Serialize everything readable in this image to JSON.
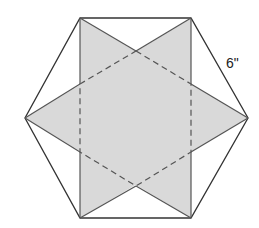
{
  "diagram": {
    "side_label": "6\"",
    "colors": {
      "fill": "#d9d9d9",
      "stroke": "#333333",
      "background": "#ffffff"
    },
    "outer_hexagon": [
      [
        80,
        18
      ],
      [
        191,
        18
      ],
      [
        248,
        118
      ],
      [
        191,
        218
      ],
      [
        80,
        218
      ],
      [
        25,
        118
      ]
    ],
    "triangle_1": [
      [
        80,
        18
      ],
      [
        248,
        118
      ],
      [
        80,
        218
      ]
    ],
    "triangle_2": [
      [
        191,
        18
      ],
      [
        25,
        118
      ],
      [
        191,
        218
      ]
    ],
    "inner_hexagon_dashed": [
      [
        136,
        51
      ],
      [
        191,
        84
      ],
      [
        191,
        152
      ],
      [
        136,
        186
      ],
      [
        80,
        152
      ],
      [
        80,
        84
      ]
    ]
  }
}
